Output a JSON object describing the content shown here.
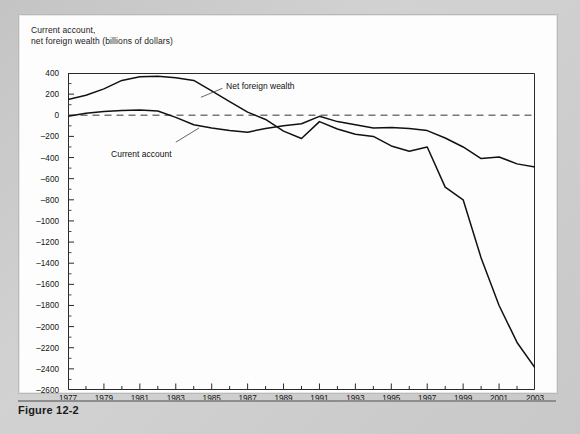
{
  "figure": {
    "caption": "Figure 12-2",
    "axis_title_line1": "Current account,",
    "axis_title_line2": "net foreign wealth (billions of dollars)"
  },
  "labels": {
    "net_foreign_wealth": "Net foreign wealth",
    "current_account": "Current account"
  },
  "chart_data": {
    "type": "line",
    "xlabel": "",
    "ylabel": "billions of dollars",
    "xlim": [
      1977,
      2003
    ],
    "ylim": [
      -2600,
      400
    ],
    "ytick_step": 200,
    "grid": false,
    "zero_reference_line": 0,
    "zero_line_style": "dashed",
    "legend_position": "inline-annotation",
    "x": [
      1977,
      1978,
      1979,
      1980,
      1981,
      1982,
      1983,
      1984,
      1985,
      1986,
      1987,
      1988,
      1989,
      1990,
      1991,
      1992,
      1993,
      1994,
      1995,
      1996,
      1997,
      1998,
      1999,
      2000,
      2001,
      2002,
      2003
    ],
    "xticks": [
      1977,
      1979,
      1981,
      1983,
      1985,
      1987,
      1989,
      1991,
      1993,
      1995,
      1997,
      1999,
      2001,
      2003
    ],
    "yticks": [
      400,
      200,
      0,
      -200,
      -400,
      -600,
      -800,
      -1000,
      -1200,
      -1400,
      -1600,
      -1800,
      -2000,
      -2200,
      -2400,
      -2600
    ],
    "series": [
      {
        "name": "Net foreign wealth",
        "color": "#111111",
        "values": [
          150,
          190,
          250,
          330,
          365,
          370,
          355,
          330,
          230,
          130,
          30,
          -40,
          -150,
          -220,
          -60,
          -130,
          -180,
          -200,
          -290,
          -340,
          -300,
          -680,
          -800,
          -1350,
          -1800,
          -2150,
          -2390
        ]
      },
      {
        "name": "Current account",
        "color": "#111111",
        "values": [
          -10,
          20,
          35,
          45,
          50,
          40,
          -20,
          -90,
          -120,
          -145,
          -160,
          -125,
          -100,
          -80,
          -10,
          -60,
          -90,
          -120,
          -115,
          -125,
          -145,
          -215,
          -300,
          -410,
          -395,
          -460,
          -490
        ]
      }
    ]
  }
}
